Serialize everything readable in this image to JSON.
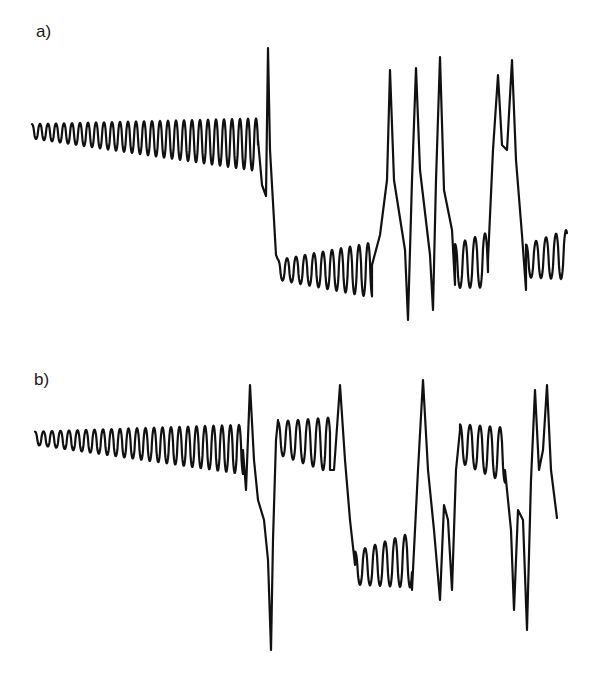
{
  "figure": {
    "panels": [
      {
        "label": "a)"
      },
      {
        "label": "b)"
      }
    ]
  },
  "chart_data": [
    {
      "type": "line",
      "title": "a)",
      "xlabel": "",
      "ylabel": "",
      "grid": false,
      "description": "Oscillation with slowly growing amplitude, followed by a spike and jump to a lower level, then alternating bursts of large spikes and small oscillations",
      "segments": [
        {
          "kind": "osc",
          "x0": 32,
          "x1": 258,
          "center0": 130,
          "center1": 140,
          "amp0": 13,
          "amp1": 48,
          "period": 8
        },
        {
          "kind": "pts",
          "points": [
            [
              258,
              140
            ],
            [
              262,
              185
            ],
            [
              266,
              196
            ],
            [
              268,
              48
            ],
            [
              270,
              150
            ],
            [
              276,
              255
            ]
          ]
        },
        {
          "kind": "osc",
          "x0": 278,
          "x1": 372,
          "center0": 268,
          "center1": 265,
          "amp0": 18,
          "amp1": 50,
          "period": 9
        },
        {
          "kind": "pts",
          "points": [
            [
              372,
              265
            ],
            [
              380,
              235
            ],
            [
              387,
              180
            ],
            [
              390,
              70
            ],
            [
              394,
              180
            ],
            [
              405,
              250
            ],
            [
              408,
              320
            ],
            [
              412,
              180
            ],
            [
              416,
              68
            ],
            [
              420,
              170
            ],
            [
              430,
              255
            ],
            [
              433,
              310
            ],
            [
              436,
              180
            ],
            [
              440,
              57
            ],
            [
              444,
              190
            ],
            [
              452,
              230
            ],
            [
              455,
              285
            ]
          ]
        },
        {
          "kind": "osc",
          "x0": 455,
          "x1": 488,
          "center0": 262,
          "center1": 255,
          "amp0": 40,
          "amp1": 50,
          "period": 10
        },
        {
          "kind": "pts",
          "points": [
            [
              488,
              260
            ],
            [
              493,
              150
            ],
            [
              498,
              75
            ],
            [
              502,
              145
            ],
            [
              507,
              150
            ],
            [
              512,
              60
            ],
            [
              516,
              160
            ],
            [
              522,
              235
            ],
            [
              526,
              290
            ]
          ]
        },
        {
          "kind": "osc",
          "x0": 526,
          "x1": 567,
          "center0": 258,
          "center1": 250,
          "amp0": 30,
          "amp1": 45,
          "period": 10
        }
      ]
    },
    {
      "type": "line",
      "title": "b)",
      "xlabel": "",
      "ylabel": "",
      "grid": false,
      "description": "Oscillation with growing amplitude, deep negative spike, alternating upper and lower oscillation bands separated by large spikes",
      "segments": [
        {
          "kind": "osc",
          "x0": 35,
          "x1": 243,
          "center0": 437,
          "center1": 445,
          "amp0": 12,
          "amp1": 45,
          "period": 8.5
        },
        {
          "kind": "pts",
          "points": [
            [
              243,
              450
            ],
            [
              246,
              490
            ],
            [
              250,
              385
            ],
            [
              254,
              460
            ],
            [
              258,
              500
            ],
            [
              264,
              520
            ],
            [
              268,
              560
            ],
            [
              271,
              650
            ],
            [
              273,
              540
            ],
            [
              276,
              440
            ],
            [
              278,
              420
            ]
          ]
        },
        {
          "kind": "osc",
          "x0": 278,
          "x1": 330,
          "center0": 435,
          "center1": 440,
          "amp0": 30,
          "amp1": 50,
          "period": 10
        },
        {
          "kind": "pts",
          "points": [
            [
              330,
              470
            ],
            [
              334,
              470
            ],
            [
              340,
              385
            ],
            [
              345,
              460
            ],
            [
              350,
              520
            ],
            [
              355,
              565
            ]
          ]
        },
        {
          "kind": "osc",
          "x0": 355,
          "x1": 412,
          "center0": 565,
          "center1": 555,
          "amp0": 30,
          "amp1": 50,
          "period": 10
        },
        {
          "kind": "pts",
          "points": [
            [
              412,
              590
            ],
            [
              418,
              470
            ],
            [
              423,
              380
            ],
            [
              428,
              470
            ],
            [
              434,
              530
            ],
            [
              440,
              600
            ],
            [
              444,
              505
            ],
            [
              448,
              520
            ],
            [
              452,
              590
            ],
            [
              456,
              470
            ],
            [
              460,
              430
            ]
          ]
        },
        {
          "kind": "osc",
          "x0": 460,
          "x1": 505,
          "center0": 440,
          "center1": 450,
          "amp0": 35,
          "amp1": 50,
          "period": 10
        },
        {
          "kind": "pts",
          "points": [
            [
              505,
              470
            ],
            [
              511,
              530
            ],
            [
              514,
              610
            ],
            [
              518,
              510
            ],
            [
              523,
              520
            ],
            [
              527,
              630
            ],
            [
              531,
              480
            ],
            [
              535,
              390
            ],
            [
              539,
              470
            ],
            [
              543,
              450
            ],
            [
              547,
              385
            ],
            [
              551,
              470
            ],
            [
              557,
              518
            ]
          ]
        }
      ]
    }
  ]
}
